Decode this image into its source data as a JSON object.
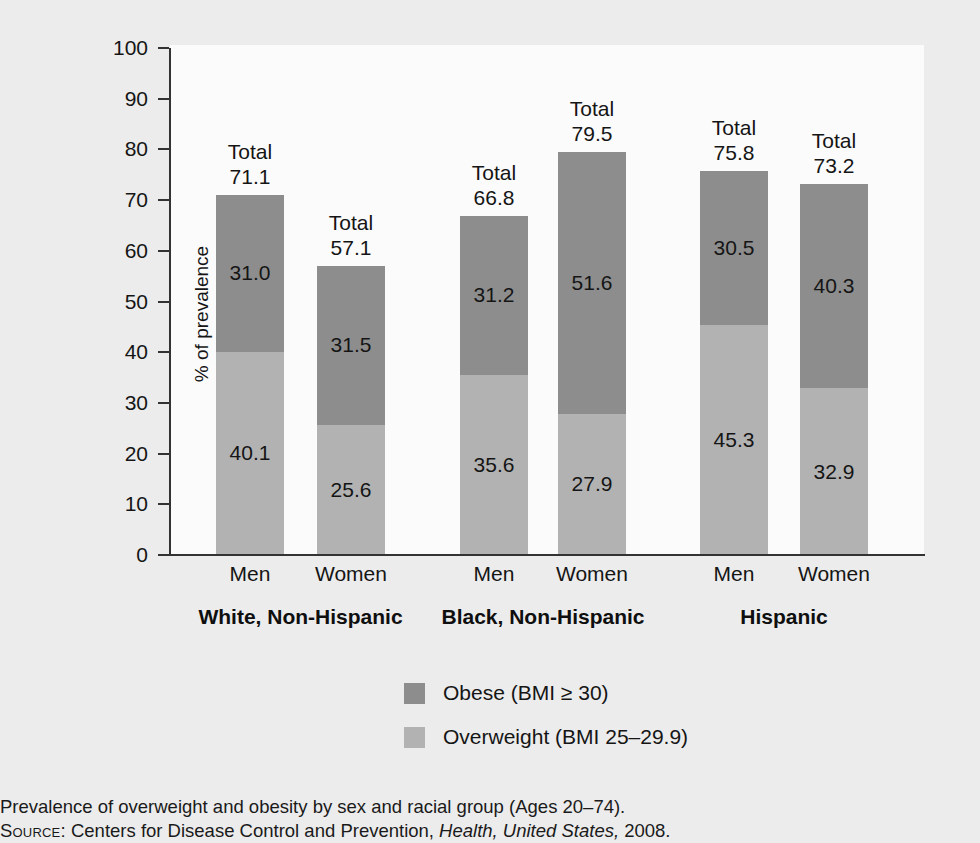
{
  "chart_data": {
    "type": "bar",
    "subtype": "stacked",
    "title": "",
    "xlabel": "",
    "ylabel": "% of prevalence",
    "ylim": [
      0,
      100
    ],
    "ytick_step": 10,
    "ytick_labels": [
      "100",
      "90",
      "80",
      "70",
      "60",
      "50",
      "40",
      "30",
      "20",
      "10",
      "0"
    ],
    "grid": false,
    "legend_position": "bottom-center",
    "categories": [
      "Men",
      "Women",
      "Men",
      "Women",
      "Men",
      "Women"
    ],
    "groups": [
      {
        "label": "White, Non-Hispanic",
        "categories": [
          "Men",
          "Women"
        ]
      },
      {
        "label": "Black, Non-Hispanic",
        "categories": [
          "Men",
          "Women"
        ]
      },
      {
        "label": "Hispanic",
        "categories": [
          "Men",
          "Women"
        ]
      }
    ],
    "series": [
      {
        "name": "Obese (BMI ≥ 30)",
        "color": "#8d8d8d",
        "values": [
          31.0,
          31.5,
          31.2,
          51.6,
          30.5,
          40.3
        ]
      },
      {
        "name": "Overweight (BMI 25–29.9)",
        "color": "#b2b2b2",
        "values": [
          40.1,
          25.6,
          35.6,
          27.9,
          45.3,
          32.9
        ]
      }
    ],
    "totals": [
      71.1,
      57.1,
      66.8,
      79.5,
      75.8,
      73.2
    ],
    "total_prefix": "Total",
    "bars": [
      {
        "group": "White, Non-Hispanic",
        "sex": "Men",
        "obese": 31.0,
        "overweight": 40.1,
        "total": 71.1,
        "total_label": "71.1",
        "obese_label": "31.0",
        "overweight_label": "40.1"
      },
      {
        "group": "White, Non-Hispanic",
        "sex": "Women",
        "obese": 31.5,
        "overweight": 25.6,
        "total": 57.1,
        "total_label": "57.1",
        "obese_label": "31.5",
        "overweight_label": "25.6"
      },
      {
        "group": "Black, Non-Hispanic",
        "sex": "Men",
        "obese": 31.2,
        "overweight": 35.6,
        "total": 66.8,
        "total_label": "66.8",
        "obese_label": "31.2",
        "overweight_label": "35.6"
      },
      {
        "group": "Black, Non-Hispanic",
        "sex": "Women",
        "obese": 51.6,
        "overweight": 27.9,
        "total": 79.5,
        "total_label": "79.5",
        "obese_label": "51.6",
        "overweight_label": "27.9"
      },
      {
        "group": "Hispanic",
        "sex": "Men",
        "obese": 30.5,
        "overweight": 45.3,
        "total": 75.8,
        "total_label": "75.8",
        "obese_label": "30.5",
        "overweight_label": "45.3"
      },
      {
        "group": "Hispanic",
        "sex": "Women",
        "obese": 40.3,
        "overweight": 32.9,
        "total": 73.2,
        "total_label": "73.2",
        "obese_label": "40.3",
        "overweight_label": "32.9"
      }
    ]
  },
  "axis": {
    "y_title": "% of prevalence",
    "ticks": [
      "100",
      "90",
      "80",
      "70",
      "60",
      "50",
      "40",
      "30",
      "20",
      "10",
      "0"
    ]
  },
  "xaxis": {
    "cat_labels": [
      "Men",
      "Women",
      "Men",
      "Women",
      "Men",
      "Women"
    ],
    "group_labels": [
      "White, Non-Hispanic",
      "Black, Non-Hispanic",
      "Hispanic"
    ]
  },
  "legend": {
    "items": [
      {
        "label": "Obese (BMI ≥ 30)",
        "color": "#8d8d8d"
      },
      {
        "label": "Overweight (BMI 25–29.9)",
        "color": "#b2b2b2"
      }
    ]
  },
  "caption": {
    "text": "Prevalence of overweight and obesity by sex and racial group (Ages 20–74).",
    "source_label": "Source:",
    "source_pre": "Centers for Disease Control and Prevention,",
    "source_italic": "Health, United States,",
    "source_post": "2008."
  },
  "colors": {
    "obese": "#8d8d8d",
    "overweight": "#b2b2b2",
    "page_background": "#ececec",
    "plot_background": "#fbfbfb",
    "axis": "#333333",
    "text": "#151515"
  }
}
